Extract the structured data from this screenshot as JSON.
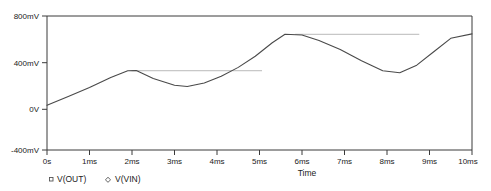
{
  "chart_data": {
    "type": "line",
    "title": "",
    "xlabel": "Time",
    "ylabel": "",
    "xlim": [
      0,
      10
    ],
    "ylim": [
      -400,
      800
    ],
    "grid": false,
    "legend_position": "bottom-left",
    "x_tick_labels": [
      "0s",
      "1ms",
      "2ms",
      "3ms",
      "4ms",
      "5ms",
      "6ms",
      "7ms",
      "8ms",
      "9ms",
      "10ms"
    ],
    "x_tick_values": [
      0,
      1,
      2,
      3,
      4,
      5,
      6,
      7,
      8,
      9,
      10
    ],
    "y_tick_labels": [
      "800mV",
      "400mV",
      "0V",
      "-400mV"
    ],
    "y_tick_values": [
      800,
      400,
      0,
      -400
    ],
    "series": [
      {
        "name": "V(OUT)",
        "marker": "square",
        "color": "#4a4a4a",
        "x": [
          0.0,
          0.5,
          1.0,
          1.5,
          1.9,
          2.1,
          2.5,
          3.0,
          3.3,
          3.7,
          4.1,
          4.5,
          4.9,
          5.3,
          5.6,
          6.0,
          6.4,
          6.9,
          7.4,
          7.9,
          8.3,
          8.7,
          9.1,
          9.5,
          10.0
        ],
        "y": [
          0,
          80,
          160,
          250,
          310,
          312,
          240,
          180,
          168,
          200,
          260,
          340,
          440,
          560,
          636,
          630,
          580,
          500,
          400,
          310,
          292,
          360,
          480,
          600,
          640
        ]
      },
      {
        "name": "V(VIN)",
        "marker": "diamond",
        "color": "#b9b9b9",
        "segments": [
          {
            "x": [
              2.0,
              5.05
            ],
            "y": [
              310,
              310
            ]
          },
          {
            "x": [
              5.85,
              8.75
            ],
            "y": [
              636,
              636
            ]
          }
        ]
      }
    ]
  },
  "legend": {
    "items": [
      {
        "label": "V(OUT)",
        "marker": "square-marker-icon"
      },
      {
        "label": "V(VIN)",
        "marker": "diamond-marker-icon"
      }
    ]
  }
}
